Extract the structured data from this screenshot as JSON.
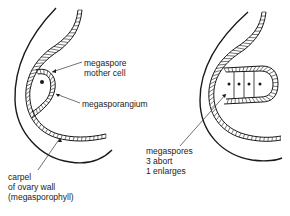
{
  "left_diagram": {
    "labels": {
      "megaspore_mother_cell": [
        "megaspore",
        "mother cell"
      ],
      "megasporangium": "megasporangium",
      "carpel": [
        "carpel",
        "of ovary wall",
        "(megasporophyll)"
      ]
    }
  },
  "right_diagram": {
    "labels": {
      "megaspores": [
        "megaspores",
        "3 abort",
        "1 enlarges"
      ]
    }
  }
}
